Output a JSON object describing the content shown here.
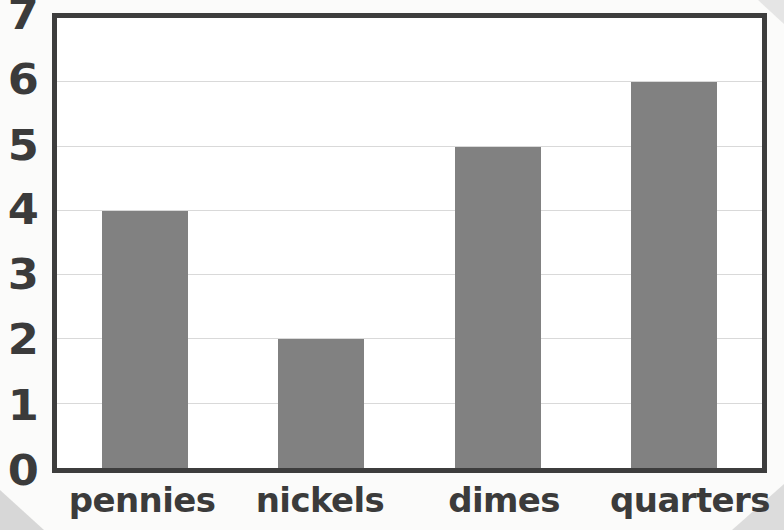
{
  "chart_data": {
    "type": "bar",
    "title": "",
    "subtitle": "",
    "xlabel": "",
    "ylabel": "",
    "categories": [
      "pennies",
      "nickels",
      "dimes",
      "quarters"
    ],
    "values": [
      4,
      2,
      5,
      6
    ],
    "ylim": [
      0,
      7
    ],
    "y_ticks": [
      0,
      1,
      2,
      3,
      4,
      5,
      6,
      7
    ],
    "y_tick_labels": [
      "0",
      "1",
      "2",
      "3",
      "4",
      "5",
      "6",
      "7"
    ],
    "grid": true,
    "legend": null,
    "annotations": [],
    "series": [
      {
        "name": "count",
        "values": [
          4,
          2,
          5,
          6
        ]
      }
    ]
  },
  "style": {
    "bar_color": "#818181",
    "grid_color": "#d9d9d9",
    "frame_color": "#3d3d3d",
    "text_color": "#3b3b3b",
    "plot_background": "#ffffff",
    "page_background": "#fbfbfa"
  }
}
